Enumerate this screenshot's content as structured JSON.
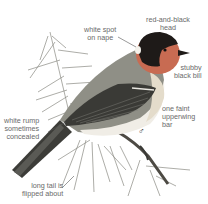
{
  "illustration": {
    "subject": "bird perched on pine branch",
    "sex_symbol": "♂",
    "colors": {
      "head_red": "#c86b52",
      "head_black": "#1e1a18",
      "back_gray": "#8f8f86",
      "wing_dark": "#3a3a36",
      "breast": "#e6e1d2",
      "belly": "#f2f0ea",
      "label_text": "#6a6a6a",
      "leader_line": "#555555"
    }
  },
  "labels": {
    "head": "red-and-black\nhead",
    "nape": "white spot\non nape",
    "bill": "stubby\nblack bill",
    "wingbar": "one faint\nupperwing\nbar",
    "rump": "white rump\nsometimes\nconcealed",
    "tail": "long tail is\nflipped about"
  }
}
